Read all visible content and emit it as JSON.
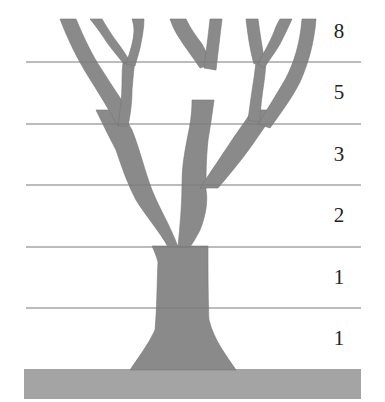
{
  "diagram": {
    "title": "",
    "levels": [
      {
        "label": "8",
        "y": 31
      },
      {
        "label": "5",
        "y": 92
      },
      {
        "label": "3",
        "y": 154
      },
      {
        "label": "2",
        "y": 215
      },
      {
        "label": "1",
        "y": 277
      },
      {
        "label": "1",
        "y": 338
      }
    ],
    "divider_lines_y": [
      62,
      124,
      185,
      247,
      308
    ],
    "colors": {
      "branch": "#8a8a8a",
      "branch_edge": "#6e6e6e",
      "ground": "#a4a4a4",
      "line": "#7a7a7a",
      "label": "#222222"
    }
  }
}
